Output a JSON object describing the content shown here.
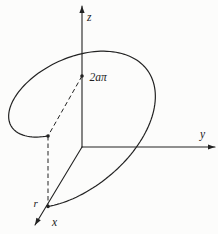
{
  "figure": {
    "name": "helix-one-turn-3d-diagram",
    "background": "#fcfcfb",
    "ink": "#222222",
    "labels": {
      "z_axis": "z",
      "y_axis": "y",
      "x_axis": "x",
      "pitch_height": "2aπ",
      "radius": "r"
    },
    "geometry": {
      "canvas": {
        "width": 218,
        "height": 234
      },
      "origin": {
        "x": 82,
        "y": 147
      },
      "axes": {
        "z_tip": {
          "x": 82,
          "y": 6
        },
        "y_tip": {
          "x": 215,
          "y": 147
        },
        "x_tip": {
          "x": 35,
          "y": 225
        }
      },
      "points": {
        "z_point": {
          "x": 82,
          "y": 76
        },
        "helix_end": {
          "x": 48,
          "y": 136
        },
        "helix_start": {
          "x": 48,
          "y": 206.5
        }
      },
      "helix": {
        "vx": {
          "x": -34,
          "y": 59.5
        },
        "vy": {
          "x": 65,
          "y": 0
        },
        "rise_px": 70.5,
        "theta_start": 0,
        "theta_end": 6.28319,
        "samples": 140
      },
      "dot_radius": 1.8,
      "arrow": {
        "length": 7,
        "half_width": 2.6
      },
      "label_anchors": {
        "z": {
          "x": 87,
          "y": 21
        },
        "y": {
          "x": 200,
          "y": 138
        },
        "x": {
          "x": 52,
          "y": 226
        },
        "pitch": {
          "x": 89.5,
          "y": 81
        },
        "r": {
          "x": 33.5,
          "y": 207
        }
      },
      "stroke": {
        "axis_width": 1.1,
        "curve_width": 1.2,
        "dash_width": 1,
        "dash_pattern": "4.5 3"
      }
    }
  }
}
